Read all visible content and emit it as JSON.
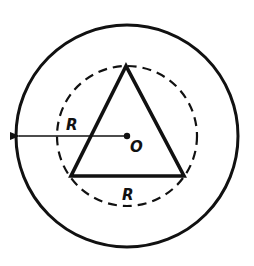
{
  "diagram": {
    "type": "geometry",
    "colors": {
      "stroke": "#111111",
      "background": "#ffffff"
    },
    "outer_circle": {
      "cx": 127,
      "cy": 136,
      "r": 111,
      "style": "solid"
    },
    "inner_circle": {
      "cx": 127,
      "cy": 136,
      "r": 70,
      "style": "dashed"
    },
    "triangle": {
      "vertices": [
        [
          126,
          66
        ],
        [
          71,
          176
        ],
        [
          184,
          176
        ]
      ],
      "side_label": "R"
    },
    "center": {
      "x": 127,
      "y": 136,
      "label": "O"
    },
    "radius_arrow": {
      "from": [
        127,
        136
      ],
      "to": [
        17,
        136
      ],
      "label": "R"
    }
  },
  "labels": {
    "center": "O",
    "radius": "R",
    "side": "R"
  }
}
